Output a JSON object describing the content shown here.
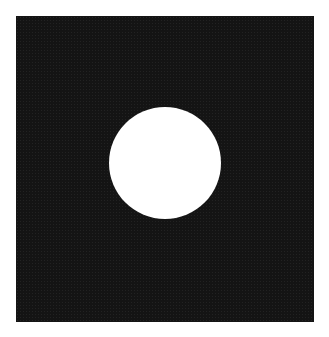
{
  "image": {
    "description": "Bright white circular spot with soft glowing edge centered-right on a dark noisy square background",
    "background_color": "#1c1c1c",
    "page_background": "#ffffff",
    "spot": {
      "color": "#ffffff",
      "center_x": 165,
      "center_y": 163,
      "core_radius": 42,
      "glow_radius": 56
    },
    "frame": {
      "left": 16,
      "top": 16,
      "width": 298,
      "height": 306
    }
  }
}
